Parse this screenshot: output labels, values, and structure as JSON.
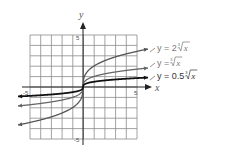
{
  "chart_data": {
    "type": "line",
    "title": "",
    "xlabel": "x",
    "ylabel": "y",
    "xlim": [
      -5,
      5
    ],
    "ylim": [
      -5,
      5
    ],
    "grid": true,
    "tick_labels": {
      "x": [
        "-5",
        "5"
      ],
      "y": [
        "5",
        "-5"
      ]
    },
    "series": [
      {
        "name": "y = 2∛x",
        "a": 2,
        "color": "#555555",
        "width": 1.3
      },
      {
        "name": "y = ∛x",
        "a": 1,
        "color": "#666666",
        "width": 1.3
      },
      {
        "name": "y = 0.5∛x",
        "a": 0.5,
        "color": "#111111",
        "width": 1.8
      }
    ],
    "legend_position": "right, inline labels"
  },
  "labels": {
    "x_axis": "x",
    "y_axis": "y",
    "x_min_tick": "-5",
    "x_max_tick": "5",
    "y_max_tick": "5",
    "y_min_tick": "-5",
    "legend": [
      {
        "prefix": "y = 2",
        "radicand": "x",
        "index": "3"
      },
      {
        "prefix": "y = ",
        "radicand": "x",
        "index": "3"
      },
      {
        "prefix": "y = 0.5",
        "radicand": "x",
        "index": "3"
      }
    ]
  }
}
